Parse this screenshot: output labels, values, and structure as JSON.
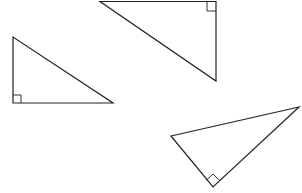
{
  "diagram": {
    "title": "",
    "stroke_color": "#222222",
    "background": "#ffffff",
    "shapes": [
      {
        "id": "triangle-left",
        "type": "right-triangle",
        "right_angle_position": "bottom-left",
        "label": ""
      },
      {
        "id": "triangle-top",
        "type": "right-triangle",
        "right_angle_position": "top-right",
        "label": ""
      },
      {
        "id": "triangle-bottom-right",
        "type": "right-triangle",
        "right_angle_position": "bottom",
        "label": ""
      }
    ]
  }
}
